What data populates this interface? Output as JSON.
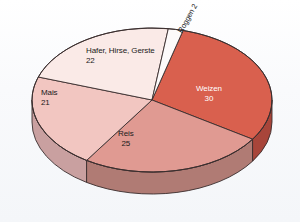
{
  "chart_data": {
    "type": "pie",
    "title": "",
    "subtitle": "",
    "xlabel": "",
    "ylabel": "",
    "legend_position": "none",
    "grid": false,
    "unit": "%",
    "total": 100,
    "three_d": true,
    "categories": [
      "Weizen",
      "Reis",
      "Hafer, Hirse, Gerste",
      "Mais",
      "Roggen"
    ],
    "values": [
      30,
      25,
      22,
      21,
      2
    ],
    "slices": [
      {
        "label": "Weizen",
        "value": 30,
        "value_text": "30",
        "color": "#d9604e",
        "side_color": "#a8453a",
        "text_color": "#ffffff",
        "start_angle": -75,
        "end_angle": 33
      },
      {
        "label": "Reis",
        "value": 25,
        "value_text": "25",
        "color": "#e09a92",
        "side_color": "#b07b74",
        "text_color": "#1a1a1a",
        "start_angle": 33,
        "end_angle": 123
      },
      {
        "label": "Mais",
        "value": 21,
        "value_text": "21",
        "color": "#f2c6c1",
        "side_color": "#c9a0a0",
        "text_color": "#1a1a1a",
        "start_angle": 123,
        "end_angle": 198.6
      },
      {
        "label": "Hafer, Hirse, Gerste",
        "value": 22,
        "value_text": "22",
        "color": "#faeae7",
        "side_color": "#d8c4c2",
        "text_color": "#1a1a1a",
        "start_angle": 198.6,
        "end_angle": 277.8
      },
      {
        "label": "Roggen",
        "value": 2,
        "value_text": "2",
        "color": "#fdfafa",
        "side_color": "#ded6d6",
        "text_color": "#1a1a1a",
        "start_angle": 277.8,
        "end_angle": 285
      }
    ],
    "colors": {
      "weizen": "#d9604e",
      "reis": "#e09a92",
      "mais": "#f2c6c1",
      "hafer_hirse_gerste": "#faeae7",
      "roggen": "#fdfafa",
      "outline": "#3a2e2e",
      "background": "#fbfcfd"
    }
  },
  "labels": {
    "weizen": {
      "name": "Weizen",
      "value": "30"
    },
    "reis": {
      "name": "Reis",
      "value": "25"
    },
    "mais": {
      "name": "Mais",
      "value": "21"
    },
    "hafer": {
      "name": "Hafer, Hirse, Gerste",
      "value": "22"
    },
    "roggen": {
      "name": "Roggen",
      "value": "2"
    }
  }
}
